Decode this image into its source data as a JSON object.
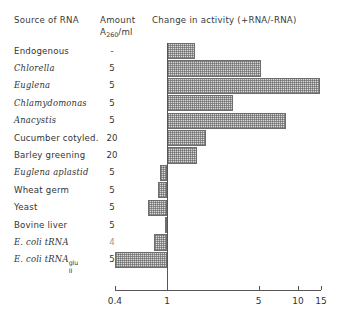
{
  "figure": {
    "headers": {
      "source": "Source of RNA",
      "amount": "Amount",
      "amount_units_base": "A",
      "amount_units_sub": "260",
      "amount_units_rest": "/ml",
      "change": "Change in activity (+RNA/-RNA)"
    }
  },
  "rows": [
    {
      "name": "Endogenous",
      "italic": false,
      "amount": "-",
      "amount_faint": false
    },
    {
      "name": "Chlorella",
      "italic": true,
      "amount": "5",
      "amount_faint": false
    },
    {
      "name": "Euglena",
      "italic": true,
      "amount": "5",
      "amount_faint": false
    },
    {
      "name": "Chlamydomonas",
      "italic": true,
      "amount": "5",
      "amount_faint": false
    },
    {
      "name": "Anacystis",
      "italic": true,
      "amount": "5",
      "amount_faint": false
    },
    {
      "name": "Cucumber cotyled.",
      "italic": false,
      "amount": "20",
      "amount_faint": false
    },
    {
      "name": "Barley greening",
      "italic": false,
      "amount": "20",
      "amount_faint": false
    },
    {
      "name": "Euglena aplastid",
      "italic": true,
      "amount": "5",
      "amount_faint": false
    },
    {
      "name": "Wheat germ",
      "italic": false,
      "amount": "5",
      "amount_faint": false
    },
    {
      "name": "Yeast",
      "italic": false,
      "amount": "5",
      "amount_faint": false
    },
    {
      "name": "Bovine liver",
      "italic": false,
      "amount": "5",
      "amount_faint": false
    },
    {
      "name": "E. coli tRNA",
      "italic": true,
      "amount": "4",
      "amount_faint": true
    },
    {
      "name": "E. coli tRNA",
      "italic": true,
      "amount": "5",
      "amount_faint": false,
      "sup": "glu",
      "sub": "II"
    }
  ],
  "chart_data": {
    "type": "bar",
    "orientation": "horizontal",
    "title": "Change in activity (+RNA/-RNA)",
    "xlabel": "",
    "ylabel": "",
    "xscale": "log",
    "baseline": 1,
    "xlim": [
      0.38,
      15.6
    ],
    "grid": false,
    "legend": null,
    "tick_values": [
      0.4,
      1,
      5,
      10,
      15
    ],
    "tick_labels": [
      "0.4",
      "1",
      "5",
      "10",
      "15"
    ],
    "categories": [
      "Endogenous",
      "Chlorella",
      "Euglena",
      "Chlamydomonas",
      "Anacystis",
      "Cucumber cotyled.",
      "Barley greening",
      "Euglena aplastid",
      "Wheat germ",
      "Yeast",
      "Bovine liver",
      "E. coli tRNA",
      "E. coli tRNA glu II"
    ],
    "values": [
      1.65,
      5.2,
      14.8,
      3.2,
      8.1,
      2.0,
      1.7,
      0.88,
      0.85,
      0.72,
      0.97,
      0.79,
      0.4
    ],
    "bar_fill": "#d8d8d8",
    "bar_edge": "#6d6d6d",
    "bar_hatch": "cross-hatch-dots"
  }
}
